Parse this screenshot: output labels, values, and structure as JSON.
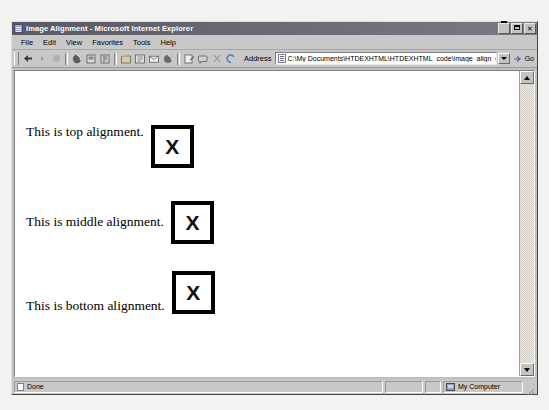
{
  "window": {
    "title": "Image Alignment - Microsoft Internet Explorer",
    "title_icon": "ie-document-icon",
    "buttons": {
      "minimize": "minimize-button",
      "maximize": "maximize-button",
      "close": "✕"
    }
  },
  "menu": {
    "items": [
      {
        "label": "File"
      },
      {
        "label": "Edit"
      },
      {
        "label": "View"
      },
      {
        "label": "Favorites"
      },
      {
        "label": "Tools"
      },
      {
        "label": "Help"
      }
    ]
  },
  "toolbar": {
    "buttons": [
      {
        "name": "back-button",
        "icon": "arrow-left-icon"
      },
      {
        "name": "forward-button",
        "icon": "arrow-right-icon"
      },
      {
        "name": "stop-button",
        "icon": "stop-x-icon"
      },
      {
        "name": "refresh-button",
        "icon": "refresh-icon"
      },
      {
        "name": "home-button",
        "icon": "home-icon"
      },
      {
        "name": "search-button",
        "icon": "search-globe-icon"
      },
      {
        "name": "favorites-button",
        "icon": "favorites-folder-icon"
      },
      {
        "name": "history-button",
        "icon": "history-clock-icon"
      },
      {
        "name": "mail-button",
        "icon": "mail-envelope-icon"
      },
      {
        "name": "print-button",
        "icon": "printer-icon"
      },
      {
        "name": "edit-button",
        "icon": "edit-pencil-icon"
      },
      {
        "name": "discuss-button",
        "icon": "discuss-icon"
      }
    ]
  },
  "address": {
    "label": "Address",
    "value": "C:\\My Documents\\HTDEXHTML\\HTDEXHTML_code\\image_align_demo",
    "placeholder": "Type a Web address",
    "go_label": "Go",
    "page_icon": "page-icon",
    "dropdown_icon": "chevron-down-icon"
  },
  "page": {
    "rows": [
      {
        "text": "This is top alignment.",
        "box_label": "X",
        "alignment": "top"
      },
      {
        "text": "This is middle alignment.",
        "box_label": "X",
        "alignment": "middle"
      },
      {
        "text": "This is bottom alignment.",
        "box_label": "X",
        "alignment": "bottom"
      }
    ]
  },
  "status": {
    "left": "Done",
    "blank1": "",
    "blank2": "",
    "zone": "My Computer",
    "doc_icon": "document-icon",
    "zone_icon": "my-computer-icon"
  },
  "colors": {
    "chrome": "#c0c0c0",
    "titlebar": "#5a5a66",
    "page_bg": "#ffffff",
    "box_border": "#000000",
    "desktop": "#f2f2f0"
  }
}
